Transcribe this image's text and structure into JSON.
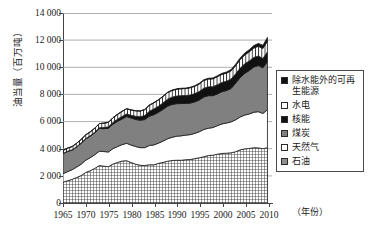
{
  "axes": {
    "y_title": "油当量（百万吨）",
    "x_title": "（年份）",
    "y_ticks": [
      "14 000",
      "12 000",
      "10 000",
      "8 000",
      "6 000",
      "4 000",
      "2 000",
      "0"
    ],
    "x_ticks": [
      "1965",
      "1970",
      "1975",
      "1980",
      "1985",
      "1990",
      "1995",
      "2000",
      "2005",
      "2010"
    ]
  },
  "legend": {
    "items": [
      {
        "label": "除水能外的可再生能源",
        "swatch": "renew",
        "color": "#111111"
      },
      {
        "label": "水电",
        "swatch": "hydro",
        "color": "#ffffff"
      },
      {
        "label": "核能",
        "swatch": "nuclear",
        "color": "#111111"
      },
      {
        "label": "煤炭",
        "swatch": "coal",
        "color": "#808080"
      },
      {
        "label": "天然气",
        "swatch": "gas",
        "color": "#ffffff"
      },
      {
        "label": "石油",
        "swatch": "oil",
        "color": "#909090"
      }
    ]
  },
  "chart_data": {
    "type": "area",
    "title": "",
    "xlabel": "（年份）",
    "ylabel": "油当量（百万吨）",
    "xlim": [
      1965,
      2011
    ],
    "ylim": [
      0,
      14000
    ],
    "grid": true,
    "legend_position": "right",
    "stacked": true,
    "x": [
      1965,
      1966,
      1967,
      1968,
      1969,
      1970,
      1971,
      1972,
      1973,
      1974,
      1975,
      1976,
      1977,
      1978,
      1979,
      1980,
      1981,
      1982,
      1983,
      1984,
      1985,
      1986,
      1987,
      1988,
      1989,
      1990,
      1991,
      1992,
      1993,
      1994,
      1995,
      1996,
      1997,
      1998,
      1999,
      2000,
      2001,
      2002,
      2003,
      2004,
      2005,
      2006,
      2007,
      2008,
      2009,
      2010
    ],
    "series": [
      {
        "name": "石油",
        "values": [
          1530,
          1640,
          1740,
          1880,
          2020,
          2250,
          2380,
          2550,
          2760,
          2710,
          2680,
          2870,
          2990,
          3090,
          3120,
          2980,
          2860,
          2780,
          2760,
          2820,
          2810,
          2920,
          2990,
          3080,
          3130,
          3150,
          3150,
          3190,
          3200,
          3270,
          3330,
          3410,
          3500,
          3520,
          3600,
          3650,
          3670,
          3700,
          3780,
          3920,
          3990,
          4020,
          4070,
          4060,
          4000,
          4080
        ]
      },
      {
        "name": "天然气",
        "values": [
          630,
          670,
          710,
          770,
          840,
          900,
          960,
          1010,
          1060,
          1080,
          1080,
          1140,
          1170,
          1210,
          1280,
          1290,
          1300,
          1300,
          1320,
          1420,
          1470,
          1490,
          1570,
          1650,
          1710,
          1770,
          1800,
          1810,
          1840,
          1860,
          1920,
          2010,
          2010,
          2040,
          2100,
          2180,
          2220,
          2280,
          2350,
          2420,
          2490,
          2540,
          2620,
          2670,
          2600,
          2790
        ]
      },
      {
        "name": "煤炭",
        "values": [
          1480,
          1490,
          1450,
          1480,
          1540,
          1570,
          1580,
          1610,
          1670,
          1690,
          1740,
          1800,
          1860,
          1890,
          1970,
          1990,
          1990,
          2020,
          2070,
          2150,
          2230,
          2270,
          2330,
          2400,
          2420,
          2400,
          2380,
          2330,
          2320,
          2320,
          2340,
          2390,
          2400,
          2350,
          2340,
          2370,
          2400,
          2460,
          2700,
          2900,
          3070,
          3200,
          3330,
          3400,
          3360,
          3560
        ]
      },
      {
        "name": "核能",
        "values": [
          10,
          12,
          15,
          20,
          25,
          30,
          40,
          50,
          60,
          80,
          110,
          130,
          160,
          190,
          190,
          200,
          240,
          260,
          300,
          370,
          420,
          450,
          480,
          520,
          540,
          560,
          580,
          590,
          600,
          610,
          630,
          650,
          650,
          660,
          680,
          680,
          690,
          700,
          690,
          700,
          710,
          710,
          710,
          700,
          690,
          710
        ]
      },
      {
        "name": "水电",
        "values": [
          220,
          230,
          240,
          250,
          260,
          270,
          280,
          290,
          300,
          320,
          330,
          340,
          350,
          370,
          380,
          390,
          400,
          410,
          430,
          440,
          450,
          460,
          470,
          480,
          490,
          500,
          510,
          510,
          530,
          540,
          550,
          570,
          570,
          580,
          590,
          600,
          590,
          600,
          600,
          630,
          650,
          670,
          690,
          720,
          740,
          780
        ]
      },
      {
        "name": "除水能外的可再生能源",
        "values": [
          2,
          2,
          3,
          3,
          4,
          4,
          5,
          5,
          6,
          7,
          8,
          9,
          10,
          11,
          12,
          13,
          14,
          15,
          17,
          19,
          21,
          23,
          25,
          28,
          30,
          33,
          36,
          39,
          42,
          46,
          50,
          55,
          60,
          66,
          72,
          80,
          88,
          97,
          108,
          122,
          138,
          158,
          182,
          210,
          235,
          280
        ]
      }
    ],
    "total_2010": 12110,
    "total_1965": 3872
  }
}
